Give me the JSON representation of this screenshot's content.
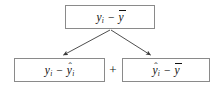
{
  "diagram": {
    "type": "flowchart",
    "background_color": "#ffffff",
    "border_color": "#8a8a8a",
    "text_color": "#111111",
    "nodes": [
      {
        "id": "total",
        "role": "total-deviation",
        "expression": "y_i - ybar",
        "parts": {
          "left_base": "y",
          "left_sub": "i",
          "left_accent": "none",
          "operator": "−",
          "right_base": "y",
          "right_sub": "",
          "right_accent": "bar"
        }
      },
      {
        "id": "residual",
        "role": "residual-deviation",
        "expression": "y_i - yhat_i",
        "parts": {
          "left_base": "y",
          "left_sub": "i",
          "left_accent": "none",
          "operator": "−",
          "right_base": "y",
          "right_sub": "i",
          "right_accent": "hat"
        }
      },
      {
        "id": "explained",
        "role": "explained-deviation",
        "expression": "yhat_i - ybar",
        "parts": {
          "left_base": "y",
          "left_sub": "i",
          "left_accent": "hat",
          "operator": "−",
          "right_base": "y",
          "right_sub": "",
          "right_accent": "bar"
        }
      }
    ],
    "operators": {
      "plus": "+"
    },
    "accents": {
      "hat": "ˆ",
      "bar": "¯"
    },
    "arrows": [
      {
        "id": "arrow-to-residual",
        "from": "total",
        "to": "residual",
        "x1": 110,
        "y1": 30,
        "x2": 62,
        "y2": 56
      },
      {
        "id": "arrow-to-explained",
        "from": "total",
        "to": "explained",
        "x1": 111,
        "y1": 30,
        "x2": 152,
        "y2": 56
      }
    ]
  }
}
